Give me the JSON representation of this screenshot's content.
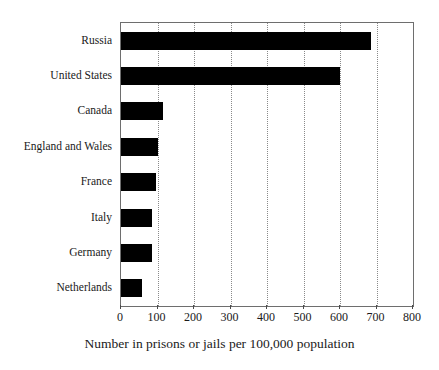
{
  "chart_data": {
    "type": "bar",
    "orientation": "horizontal",
    "title": "",
    "xlabel": "Number in prisons or jails per 100,000 population",
    "ylabel": "",
    "categories": [
      "Russia",
      "United States",
      "Canada",
      "England and Wales",
      "France",
      "Italy",
      "Germany",
      "Netherlands"
    ],
    "values": [
      685,
      600,
      115,
      100,
      95,
      85,
      85,
      58
    ],
    "xlim": [
      0,
      800
    ],
    "xticks": [
      0,
      100,
      200,
      300,
      400,
      500,
      600,
      700,
      800
    ],
    "xtick_labels": [
      "0",
      "100",
      "200",
      "300",
      "400",
      "500",
      "600",
      "700",
      "800"
    ],
    "grid": "vertical-dotted",
    "legend": "none",
    "bar_color": "#000000",
    "frame_color": "#6e6e6e",
    "gridline_color": "#8a8a8a"
  }
}
